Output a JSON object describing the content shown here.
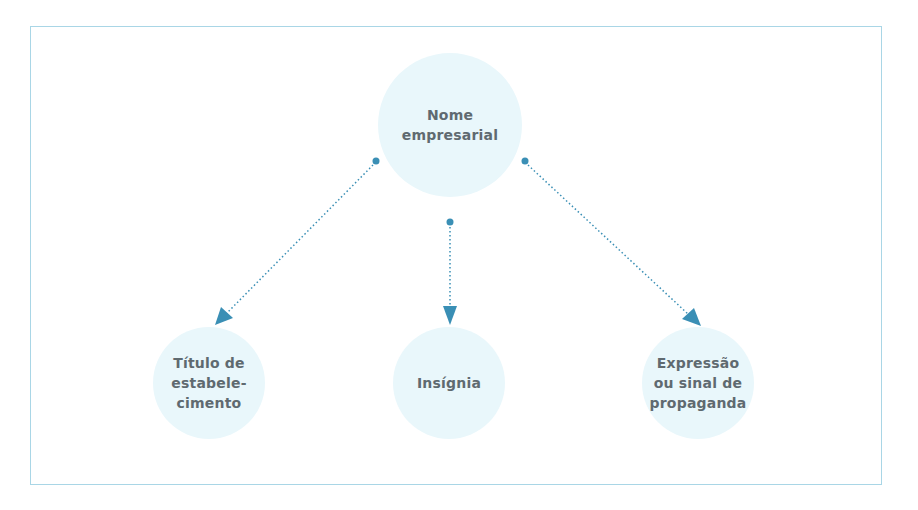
{
  "diagram": {
    "root": {
      "label": "Nome\nempresarial"
    },
    "children": [
      {
        "label": "Título de\nestabele-\ncimento"
      },
      {
        "label": "Insígnia"
      },
      {
        "label": "Expressão\nou sinal de\npropaganda"
      }
    ],
    "edges": [
      {
        "from": "Nome empresarial",
        "to": "Título de estabelecimento",
        "style": "dotted-arrow"
      },
      {
        "from": "Nome empresarial",
        "to": "Insígnia",
        "style": "dotted-arrow"
      },
      {
        "from": "Nome empresarial",
        "to": "Expressão ou sinal de propaganda",
        "style": "dotted-arrow"
      }
    ],
    "colors": {
      "node_fill": "#e9f7fb",
      "frame_border": "#a9d6e6",
      "arrow": "#3a8fb5",
      "label_text": "#5f6a70"
    }
  }
}
